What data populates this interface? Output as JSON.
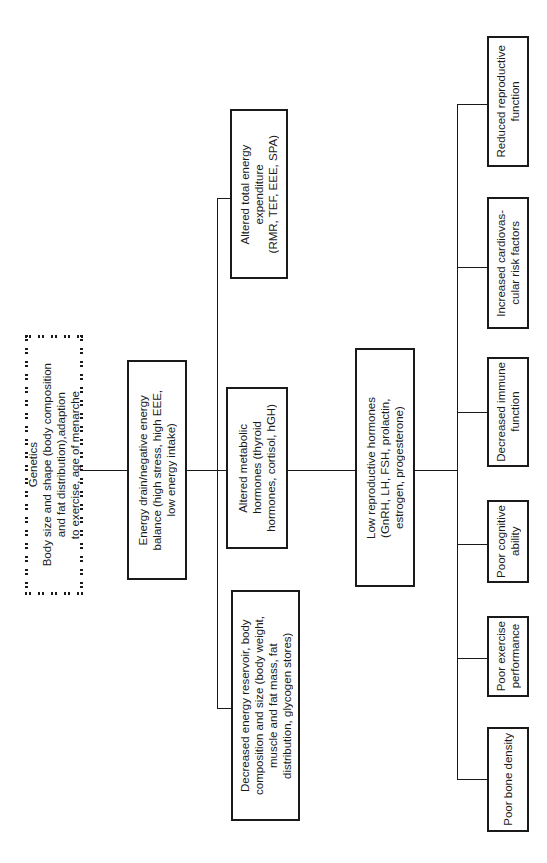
{
  "diagram": {
    "orientation": "rotated-90-ccw",
    "root": {
      "id": "genetics",
      "label": "Genetics\nBody size and shape (body composition\nand fat distribution),adaption\nto exercise, age of menarche",
      "style": "dashed"
    },
    "energy_drain": {
      "id": "energy-drain",
      "label": "Energy drain/negative energy\nbalance (high stress, high EEE,\nlow energy intake)"
    },
    "mediators": [
      {
        "id": "total-energy-expenditure",
        "label": "Altered total energy\nexpenditure\n(RMR, TEF, EEE, SPA)"
      },
      {
        "id": "metabolic-hormones",
        "label": "Altered metabolic\nhormones (thyroid\nhormones, cortisol, hGH)"
      },
      {
        "id": "energy-reservoir",
        "label": "Decreased energy reservoir, body\ncomposition and size (body weight,\nmuscle and fat mass, fat\ndistribution, glycogen stores)"
      }
    ],
    "reproductive_hormones": {
      "id": "low-reproductive-hormones",
      "label": "Low reproductive hormones\n(GnRH, LH, FSH, prolactin,\nestrogen, progesterone)"
    },
    "outcomes": [
      {
        "id": "reduced-reproductive-function",
        "label": "Reduced reproductive\nfunction"
      },
      {
        "id": "cardiovascular-risk",
        "label": "Increased cardiovas-\ncular risk factors"
      },
      {
        "id": "immune-function",
        "label": "Decreased immune\nfunction"
      },
      {
        "id": "cognitive-ability",
        "label": "Poor cognitive\nability"
      },
      {
        "id": "exercise-performance",
        "label": "Poor exercise\nperformance"
      },
      {
        "id": "bone-density",
        "label": "Poor bone density"
      }
    ],
    "edges": [
      [
        "genetics",
        "energy-drain"
      ],
      [
        "energy-drain",
        "total-energy-expenditure"
      ],
      [
        "energy-drain",
        "metabolic-hormones"
      ],
      [
        "energy-drain",
        "energy-reservoir"
      ],
      [
        "metabolic-hormones",
        "low-reproductive-hormones"
      ],
      [
        "low-reproductive-hormones",
        "reduced-reproductive-function"
      ],
      [
        "low-reproductive-hormones",
        "cardiovascular-risk"
      ],
      [
        "low-reproductive-hormones",
        "immune-function"
      ],
      [
        "low-reproductive-hormones",
        "cognitive-ability"
      ],
      [
        "low-reproductive-hormones",
        "exercise-performance"
      ],
      [
        "low-reproductive-hormones",
        "bone-density"
      ]
    ]
  }
}
